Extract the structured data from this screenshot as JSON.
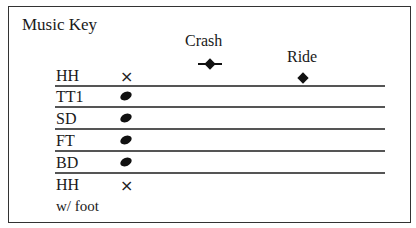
{
  "title": "Music Key",
  "cymbals": [
    {
      "label": "Crash",
      "symbol": "diamond-with-ledger"
    },
    {
      "label": "Ride",
      "symbol": "diamond"
    }
  ],
  "rows": [
    {
      "label": "HH",
      "symbol": "x"
    },
    {
      "label": "TT1",
      "symbol": "oval"
    },
    {
      "label": "SD",
      "symbol": "oval"
    },
    {
      "label": "FT",
      "symbol": "oval"
    },
    {
      "label": "BD",
      "symbol": "oval"
    },
    {
      "label": "HH",
      "symbol": "x"
    }
  ],
  "footnote": "w/ foot",
  "glyphs": {
    "x": "×"
  }
}
